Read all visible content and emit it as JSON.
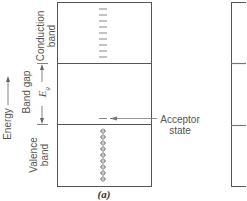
{
  "diagram": {
    "axis_label": "Energy",
    "panel_a": {
      "caption": "(a)",
      "conduction_band_label_line1": "Conduction",
      "conduction_band_label_line2": "band",
      "band_gap_label": "Band gap",
      "gap_symbol": "E",
      "gap_subscript": "g",
      "valence_band_label_line1": "Valence",
      "valence_band_label_line2": "band",
      "acceptor_label_line1": "Acceptor",
      "acceptor_label_line2": "state",
      "conduction_empty_states": 9,
      "valence_holes": 9
    },
    "colors": {
      "line": "#555555",
      "text": "#555555",
      "background": "#ffffff"
    }
  }
}
